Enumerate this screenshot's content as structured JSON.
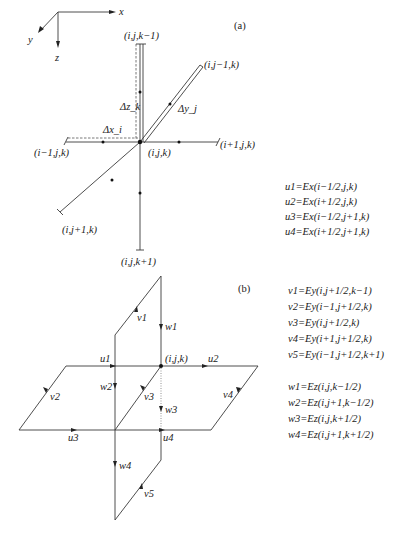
{
  "panel_a": {
    "label": "(a)",
    "axes": {
      "x": "x",
      "y": "y",
      "z": "z"
    },
    "nodes": {
      "center": "(i,j,k)",
      "top": "(i,j,k−1)",
      "upper_right": "(i,j−1,k)",
      "left": "(i−1,j,k)",
      "right": "(i+1,j,k)",
      "lower_left": "(i,j+1,k)",
      "bottom": "(i,j,k+1)"
    },
    "deltas": {
      "dx": "Δx_i",
      "dy": "Δy_j",
      "dz": "Δz_k"
    },
    "equations": [
      "u1=Ex(i−1/2,j,k)",
      "u2=Ex(i+1/2,j,k)",
      "u3=Ex(i−1/2,j+1,k)",
      "u4=Ex(i+1/2,j+1,k)"
    ]
  },
  "panel_b": {
    "label": "(b)",
    "center": "(i,j,k)",
    "edge_labels": {
      "u1": "u1",
      "u2": "u2",
      "u3": "u3",
      "u4": "u4",
      "v1": "v1",
      "v2": "v2",
      "v3": "v3",
      "v4": "v4",
      "v5": "v5",
      "w1": "w1",
      "w2": "w2",
      "w3": "w3",
      "w4": "w4"
    },
    "v_equations": [
      "v1=Ey(i,j+1/2,k−1)",
      "v2=Ey(i−1,j+1/2,k)",
      "v3=Ey(i,j+1/2,k)",
      "v4=Ey(i+1,j+1/2,k)",
      "v5=Ey(i−1,j+1/2,k+1)"
    ],
    "w_equations": [
      "w1=Ez(i,j,k−1/2)",
      "w2=Ez(i,j+1,k−1/2)",
      "w3=Ez(i,j,k+1/2)",
      "w4=Ez(i,j+1,k+1/2)"
    ]
  }
}
